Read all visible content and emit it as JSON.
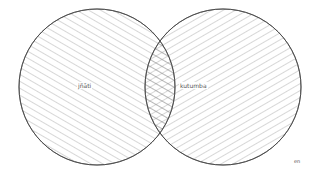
{
  "diagram": {
    "type": "venn",
    "sets": [
      {
        "label": "jñāti",
        "hatch": "descending-diagonal"
      },
      {
        "label": "kutumba",
        "hatch": "ascending-diagonal"
      }
    ],
    "intersection_hatch": "crosshatch",
    "lang_tag": "en"
  },
  "colors": {
    "stroke": "#444444",
    "hatch": "#666666",
    "background": "#ffffff"
  }
}
